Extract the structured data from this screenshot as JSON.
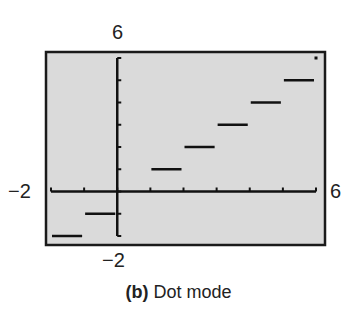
{
  "chart_data": {
    "type": "line",
    "subtype": "step (dot mode, greatest integer function)",
    "title": "",
    "caption_tag": "(b)",
    "caption_text": "Dot mode",
    "xlim": [
      -2,
      6
    ],
    "ylim": [
      -2,
      6
    ],
    "xscale": 1,
    "yscale": 1,
    "grid": false,
    "window_labels": {
      "xmin": "−2",
      "xmax": "6",
      "ymin": "−2",
      "ymax": "6"
    },
    "segments": [
      {
        "x_start": -2,
        "x_end": -1,
        "y": -2
      },
      {
        "x_start": -1,
        "x_end": 0,
        "y": -1
      },
      {
        "x_start": 0,
        "x_end": 1,
        "y": 0
      },
      {
        "x_start": 1,
        "x_end": 2,
        "y": 1
      },
      {
        "x_start": 2,
        "x_end": 3,
        "y": 2
      },
      {
        "x_start": 3,
        "x_end": 4,
        "y": 3
      },
      {
        "x_start": 4,
        "x_end": 5,
        "y": 4
      },
      {
        "x_start": 5,
        "x_end": 6,
        "y": 5
      }
    ],
    "isolated_points": [
      {
        "x": 6,
        "y": 6
      }
    ],
    "colors": {
      "screen_bg": "#d9d9d9",
      "frame": "#1a1a1a",
      "plot": "#111111"
    }
  }
}
